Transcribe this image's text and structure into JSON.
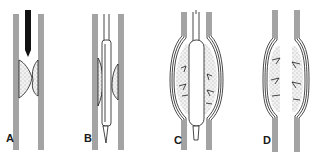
{
  "figure": {
    "panels": [
      {
        "label": "A",
        "description": "vessel stenosis with guide catheter above plaque"
      },
      {
        "label": "B",
        "description": "balloon catheter positioned across stenosis"
      },
      {
        "label": "C",
        "description": "balloon inflated, vessel and plaque stretched with cracks"
      },
      {
        "label": "D",
        "description": "after deflation, dilated vessel with fissured plaque"
      }
    ],
    "colors": {
      "line": "#1a1a1a",
      "plaque_fill": "#e6e6e6",
      "background": "#ffffff"
    }
  }
}
